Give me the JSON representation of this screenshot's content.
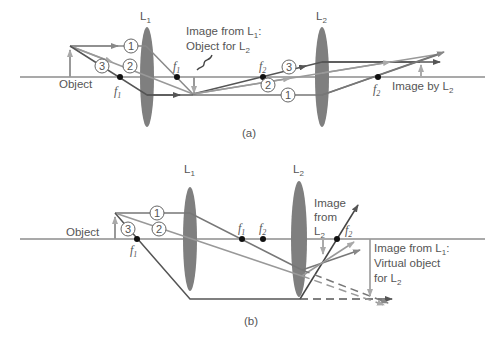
{
  "colors": {
    "axis": "#555555",
    "lens": "#7a7a7a",
    "ray_dark": "#555555",
    "ray_mid": "#777777",
    "ray_light": "#999999",
    "arrow_light": "#a9a9a9",
    "focal_point": "#111111"
  },
  "panel_a": {
    "caption": "(a)",
    "lens1_label": "L",
    "lens1_sub": "1",
    "lens2_label": "L",
    "lens2_sub": "2",
    "object_label": "Object",
    "f1_left": "f",
    "f1_left_sub": "1",
    "f1_right": "f",
    "f1_right_sub": "1",
    "f2_left": "f",
    "f2_left_sub": "2",
    "f2_right": "f",
    "f2_right_sub": "2",
    "image_l1_line1": "Image from L",
    "image_l1_line1_sub": "1",
    "image_l1_line1_suffix": ":",
    "image_l1_line2": "Object for L",
    "image_l1_line2_sub": "2",
    "image_l2_label": "Image by L",
    "image_l2_sub": "2",
    "ray_numbers_left": [
      "1",
      "2",
      "3"
    ],
    "ray_numbers_right": [
      "3",
      "2",
      "1"
    ]
  },
  "panel_b": {
    "caption": "(b)",
    "lens1_label": "L",
    "lens1_sub": "1",
    "lens2_label": "L",
    "lens2_sub": "2",
    "object_label": "Object",
    "f1_left": "f",
    "f1_left_sub": "1",
    "f1_right": "f",
    "f1_right_sub": "1",
    "f2_left": "f",
    "f2_left_sub": "2",
    "f2_right": "f",
    "f2_right_sub": "2",
    "image_l2_line1": "Image",
    "image_l2_line2": "from",
    "image_l2_line3": "L",
    "image_l2_line3_sub": "2",
    "virtual_line1": "Image from L",
    "virtual_line1_sub": "1",
    "virtual_line1_suffix": ":",
    "virtual_line2": "Virtual object",
    "virtual_line3": "for L",
    "virtual_line3_sub": "2",
    "ray_numbers": [
      "1",
      "2",
      "3"
    ]
  }
}
